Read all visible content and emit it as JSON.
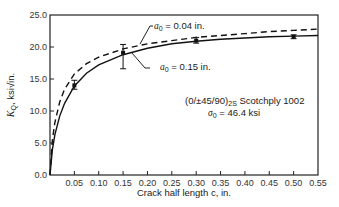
{
  "chart_data": {
    "type": "line",
    "title": "",
    "xlabel": "Crack half length c, in.",
    "ylabel": "K_Q, ksi√in.",
    "xlim": [
      0,
      0.55
    ],
    "ylim": [
      0,
      25
    ],
    "grid": false,
    "x_ticks": [
      0.05,
      0.1,
      0.15,
      0.2,
      0.25,
      0.3,
      0.35,
      0.4,
      0.45,
      0.5,
      0.55
    ],
    "x_tick_labels": [
      "0.05",
      "0.10",
      "0.15",
      "0.20",
      "0.25",
      "0.30",
      "0.35",
      "0.40",
      "0.45",
      "0.50",
      "0.55"
    ],
    "y_ticks": [
      0,
      5,
      10,
      15,
      20,
      25
    ],
    "y_tick_labels": [
      "0.0",
      "5.0",
      "10.0",
      "15.0",
      "20.0",
      "25.0"
    ],
    "series": [
      {
        "name": "a0 = 0.04 in.",
        "style": "dashed",
        "x": [
          0,
          0.005,
          0.01,
          0.02,
          0.03,
          0.05,
          0.075,
          0.1,
          0.15,
          0.2,
          0.25,
          0.3,
          0.35,
          0.4,
          0.45,
          0.5,
          0.55
        ],
        "y": [
          0,
          5.5,
          8.2,
          11.4,
          13.4,
          15.8,
          17.4,
          18.4,
          19.7,
          20.5,
          21.0,
          21.5,
          21.8,
          22.1,
          22.4,
          22.6,
          22.8
        ]
      },
      {
        "name": "a0 = 0.15 in.",
        "style": "solid",
        "x": [
          0,
          0.005,
          0.01,
          0.02,
          0.03,
          0.05,
          0.075,
          0.1,
          0.15,
          0.2,
          0.25,
          0.3,
          0.35,
          0.4,
          0.45,
          0.5,
          0.55
        ],
        "y": [
          0,
          4.0,
          6.3,
          9.2,
          11.2,
          13.9,
          15.9,
          17.2,
          18.8,
          19.8,
          20.5,
          20.9,
          21.2,
          21.4,
          21.6,
          21.7,
          21.8
        ]
      }
    ],
    "error_bars": [
      {
        "x": 0.05,
        "y": 14.0,
        "low": 13.4,
        "high": 14.8
      },
      {
        "x": 0.15,
        "y": 19.1,
        "low": 16.6,
        "high": 20.4
      },
      {
        "x": 0.3,
        "y": 21.0,
        "low": 20.6,
        "high": 21.5
      },
      {
        "x": 0.5,
        "y": 21.6,
        "low": 21.3,
        "high": 21.9
      }
    ],
    "annotations": [
      {
        "text": "a0 = 0.04 in.",
        "target": "dashed curve"
      },
      {
        "text": "a0 = 0.15 in.",
        "target": "solid curve"
      },
      {
        "text": "(0/±45/90)2S Scotchply 1002"
      },
      {
        "text": "σ0 = 46.4 ksi"
      }
    ]
  },
  "labels": {
    "xlabel": "Crack half length c, in.",
    "ylabel_main": "K",
    "ylabel_sub": "Q",
    "ylabel_units": ", ksi√in.",
    "curve1_var": "a",
    "curve1_sub": "0",
    "curve1_value": " = 0.04  in.",
    "curve2_var": "a",
    "curve2_sub": "0",
    "curve2_value": " = 0.15  in.",
    "material_main": "(0/±45/90)",
    "material_sub": "2S",
    "material_name": " Scotchply 1002",
    "sigma_var": "σ",
    "sigma_sub": "0",
    "sigma_value": " = 46.4  ksi"
  }
}
